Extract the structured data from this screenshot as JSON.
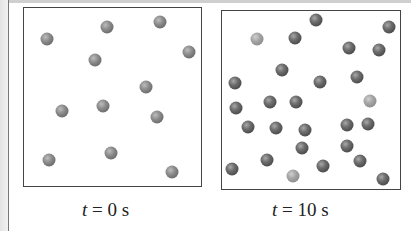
{
  "figure": {
    "panels": [
      {
        "id": "t0",
        "caption_var": "t",
        "caption_eq": " = 0 s",
        "box": {
          "left": 23,
          "top": 7,
          "width": 179,
          "height": 180
        },
        "particles": [
          {
            "x": 47,
            "y": 39,
            "shade": "medium"
          },
          {
            "x": 107,
            "y": 27,
            "shade": "medium"
          },
          {
            "x": 160,
            "y": 22,
            "shade": "medium"
          },
          {
            "x": 189,
            "y": 52,
            "shade": "medium"
          },
          {
            "x": 95,
            "y": 60,
            "shade": "medium"
          },
          {
            "x": 146,
            "y": 87,
            "shade": "medium"
          },
          {
            "x": 62,
            "y": 111,
            "shade": "medium"
          },
          {
            "x": 103,
            "y": 106,
            "shade": "medium"
          },
          {
            "x": 157,
            "y": 117,
            "shade": "medium"
          },
          {
            "x": 49,
            "y": 160,
            "shade": "medium"
          },
          {
            "x": 111,
            "y": 153,
            "shade": "medium"
          },
          {
            "x": 172,
            "y": 172,
            "shade": "medium"
          }
        ]
      },
      {
        "id": "t10",
        "caption_var": "t",
        "caption_eq": " = 10 s",
        "box": {
          "left": 221,
          "top": 10,
          "width": 180,
          "height": 180
        },
        "particles": [
          {
            "x": 316,
            "y": 20,
            "shade": "dark"
          },
          {
            "x": 389,
            "y": 27,
            "shade": "dark"
          },
          {
            "x": 257,
            "y": 39,
            "shade": "light"
          },
          {
            "x": 295,
            "y": 38,
            "shade": "dark"
          },
          {
            "x": 349,
            "y": 48,
            "shade": "dark"
          },
          {
            "x": 379,
            "y": 50,
            "shade": "dark"
          },
          {
            "x": 282,
            "y": 70,
            "shade": "dark"
          },
          {
            "x": 235,
            "y": 83,
            "shade": "dark"
          },
          {
            "x": 320,
            "y": 82,
            "shade": "dark"
          },
          {
            "x": 357,
            "y": 77,
            "shade": "dark"
          },
          {
            "x": 236,
            "y": 108,
            "shade": "dark"
          },
          {
            "x": 270,
            "y": 102,
            "shade": "dark"
          },
          {
            "x": 296,
            "y": 102,
            "shade": "dark"
          },
          {
            "x": 370,
            "y": 101,
            "shade": "light"
          },
          {
            "x": 248,
            "y": 127,
            "shade": "dark"
          },
          {
            "x": 276,
            "y": 128,
            "shade": "dark"
          },
          {
            "x": 305,
            "y": 130,
            "shade": "dark"
          },
          {
            "x": 347,
            "y": 125,
            "shade": "dark"
          },
          {
            "x": 368,
            "y": 124,
            "shade": "dark"
          },
          {
            "x": 302,
            "y": 148,
            "shade": "dark"
          },
          {
            "x": 347,
            "y": 146,
            "shade": "dark"
          },
          {
            "x": 267,
            "y": 160,
            "shade": "dark"
          },
          {
            "x": 360,
            "y": 161,
            "shade": "dark"
          },
          {
            "x": 232,
            "y": 169,
            "shade": "dark"
          },
          {
            "x": 323,
            "y": 166,
            "shade": "dark"
          },
          {
            "x": 293,
            "y": 176,
            "shade": "light"
          },
          {
            "x": 383,
            "y": 179,
            "shade": "dark"
          }
        ]
      }
    ]
  },
  "labels": {
    "left_caption": "t = 0 s",
    "right_caption": "t = 10 s",
    "left_var": "t",
    "left_eq": " = 0 s",
    "right_var": "t",
    "right_eq": " = 10 s"
  }
}
